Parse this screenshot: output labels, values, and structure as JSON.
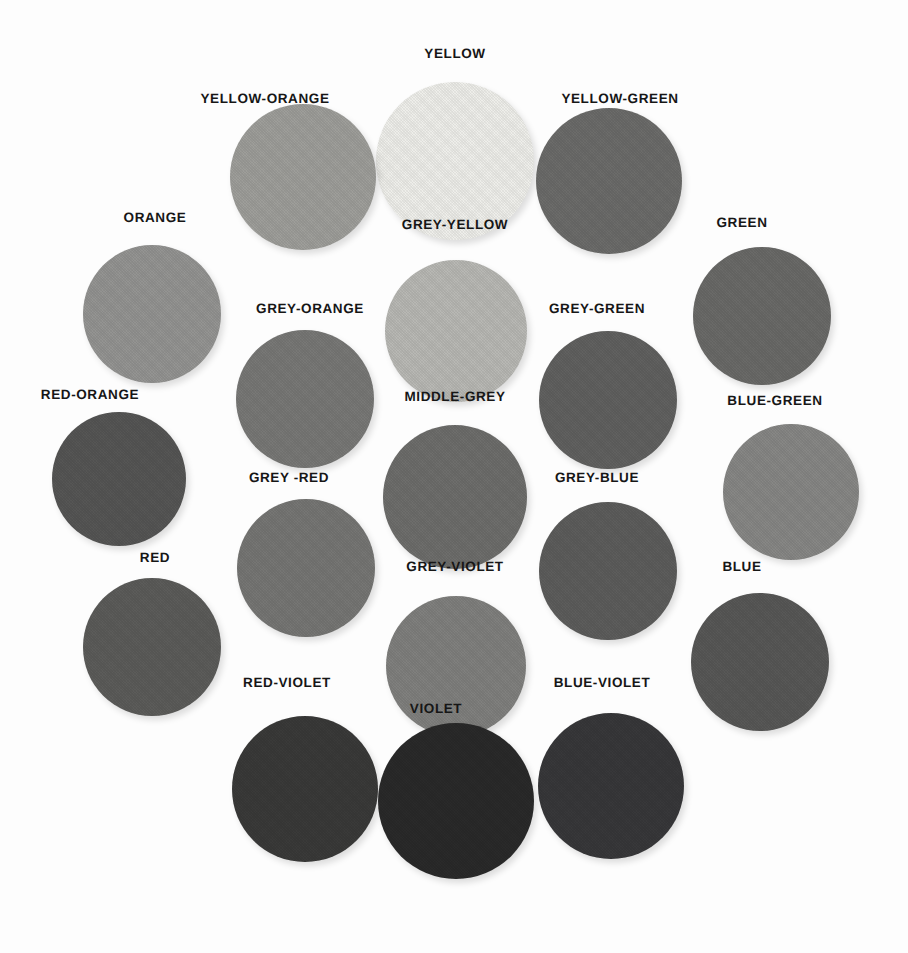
{
  "page": {
    "background": "#fdfdfd",
    "label_color": "#161616",
    "width": 908,
    "height": 953
  },
  "chart_data": {
    "type": "scatter",
    "xlabel": "",
    "ylabel": "",
    "legend_position": "none",
    "grid": false,
    "categories": [
      "YELLOW",
      "YELLOW-ORANGE",
      "YELLOW-GREEN",
      "ORANGE",
      "GREY-YELLOW",
      "GREEN",
      "GREY-ORANGE",
      "GREY-GREEN",
      "RED-ORANGE",
      "MIDDLE-GREY",
      "BLUE-GREEN",
      "GREY -RED",
      "GREY-BLUE",
      "RED",
      "GREY-VIOLET",
      "BLUE",
      "RED-VIOLET",
      "BLUE-VIOLET",
      "VIOLET"
    ],
    "values": [
      238,
      158,
      108,
      148,
      184,
      106,
      120,
      97,
      86,
      110,
      135,
      118,
      93,
      92,
      128,
      88,
      58,
      56,
      42
    ],
    "ylim": [
      0,
      255
    ]
  },
  "swatches": [
    {
      "name": "yellow",
      "label": "YELLOW",
      "color": "#eeeeea",
      "grey_value": 238,
      "cx": 455,
      "cy": 161,
      "r": 79,
      "lx": 455,
      "ly": 53
    },
    {
      "name": "yellow-orange",
      "label": "YELLOW-ORANGE",
      "color": "#9e9e9a",
      "grey_value": 158,
      "cx": 303,
      "cy": 177,
      "r": 73,
      "lx": 265,
      "ly": 98
    },
    {
      "name": "yellow-green",
      "label": "YELLOW-GREEN",
      "color": "#6c6c6a",
      "grey_value": 108,
      "cx": 609,
      "cy": 181,
      "r": 73,
      "lx": 620,
      "ly": 98
    },
    {
      "name": "orange",
      "label": "ORANGE",
      "color": "#949492",
      "grey_value": 148,
      "cx": 152,
      "cy": 314,
      "r": 69,
      "lx": 155,
      "ly": 217
    },
    {
      "name": "grey-yellow",
      "label": "GREY-YELLOW",
      "color": "#b8b8b4",
      "grey_value": 184,
      "cx": 456,
      "cy": 331,
      "r": 71,
      "lx": 455,
      "ly": 224
    },
    {
      "name": "green",
      "label": "GREEN",
      "color": "#6a6a68",
      "grey_value": 106,
      "cx": 762,
      "cy": 316,
      "r": 69,
      "lx": 742,
      "ly": 222
    },
    {
      "name": "grey-orange",
      "label": "GREY-ORANGE",
      "color": "#787876",
      "grey_value": 120,
      "cx": 305,
      "cy": 399,
      "r": 69,
      "lx": 310,
      "ly": 308
    },
    {
      "name": "grey-green",
      "label": "GREY-GREEN",
      "color": "#616160",
      "grey_value": 97,
      "cx": 608,
      "cy": 400,
      "r": 69,
      "lx": 597,
      "ly": 308
    },
    {
      "name": "red-orange",
      "label": "RED-ORANGE",
      "color": "#565655",
      "grey_value": 86,
      "cx": 119,
      "cy": 479,
      "r": 67,
      "lx": 90,
      "ly": 394
    },
    {
      "name": "middle-grey",
      "label": "MIDDLE-GREY",
      "color": "#6e6e6c",
      "grey_value": 110,
      "cx": 455,
      "cy": 497,
      "r": 72,
      "lx": 455,
      "ly": 396
    },
    {
      "name": "blue-green",
      "label": "BLUE-GREEN",
      "color": "#878785",
      "grey_value": 135,
      "cx": 791,
      "cy": 492,
      "r": 68,
      "lx": 775,
      "ly": 400
    },
    {
      "name": "grey-red",
      "label": "GREY -RED",
      "color": "#767674",
      "grey_value": 118,
      "cx": 306,
      "cy": 568,
      "r": 69,
      "lx": 289,
      "ly": 477
    },
    {
      "name": "grey-blue",
      "label": "GREY-BLUE",
      "color": "#5d5d5c",
      "grey_value": 93,
      "cx": 608,
      "cy": 571,
      "r": 69,
      "lx": 597,
      "ly": 477
    },
    {
      "name": "red",
      "label": "RED",
      "color": "#5c5c5a",
      "grey_value": 92,
      "cx": 152,
      "cy": 647,
      "r": 69,
      "lx": 155,
      "ly": 557
    },
    {
      "name": "grey-violet",
      "label": "GREY-VIOLET",
      "color": "#80807e",
      "grey_value": 128,
      "cx": 456,
      "cy": 666,
      "r": 70,
      "lx": 455,
      "ly": 566
    },
    {
      "name": "blue",
      "label": "BLUE",
      "color": "#585857",
      "grey_value": 88,
      "cx": 760,
      "cy": 662,
      "r": 69,
      "lx": 742,
      "ly": 566
    },
    {
      "name": "red-violet",
      "label": "RED-VIOLET",
      "color": "#3a3a39",
      "grey_value": 58,
      "cx": 305,
      "cy": 789,
      "r": 73,
      "lx": 287,
      "ly": 682
    },
    {
      "name": "blue-violet",
      "label": "BLUE-VIOLET",
      "color": "#38383a",
      "grey_value": 56,
      "cx": 611,
      "cy": 786,
      "r": 73,
      "lx": 602,
      "ly": 682
    },
    {
      "name": "violet",
      "label": "VIOLET",
      "color": "#2a2a2a",
      "grey_value": 42,
      "cx": 456,
      "cy": 801,
      "r": 78,
      "lx": 436,
      "ly": 708
    }
  ]
}
